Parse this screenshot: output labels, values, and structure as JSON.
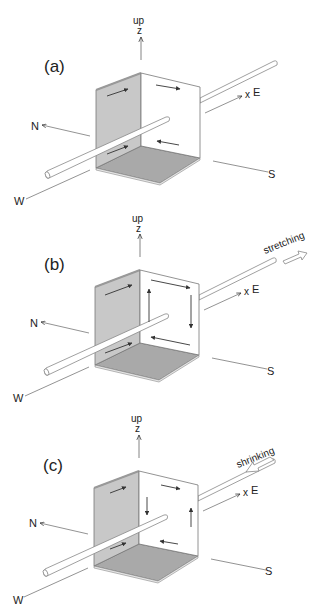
{
  "figure": {
    "panels": [
      {
        "id": "a",
        "label": "(a)",
        "up_label": "up",
        "z_label": "z",
        "x_label": "x",
        "east_label": "E",
        "north_label": "N",
        "south_label": "S",
        "west_label": "W",
        "annotation": ""
      },
      {
        "id": "b",
        "label": "(b)",
        "up_label": "up",
        "z_label": "z",
        "x_label": "x",
        "east_label": "E",
        "north_label": "N",
        "south_label": "S",
        "west_label": "W",
        "annotation": "stretching"
      },
      {
        "id": "c",
        "label": "(c)",
        "up_label": "up",
        "z_label": "z",
        "x_label": "x",
        "east_label": "E",
        "north_label": "N",
        "south_label": "S",
        "west_label": "W",
        "annotation": "shrinking"
      }
    ],
    "colors": {
      "line": "#555555",
      "shaded_face": "#c8c8c8",
      "floor_face": "#a9a9a9",
      "rod_fill": "#ffffff"
    }
  }
}
